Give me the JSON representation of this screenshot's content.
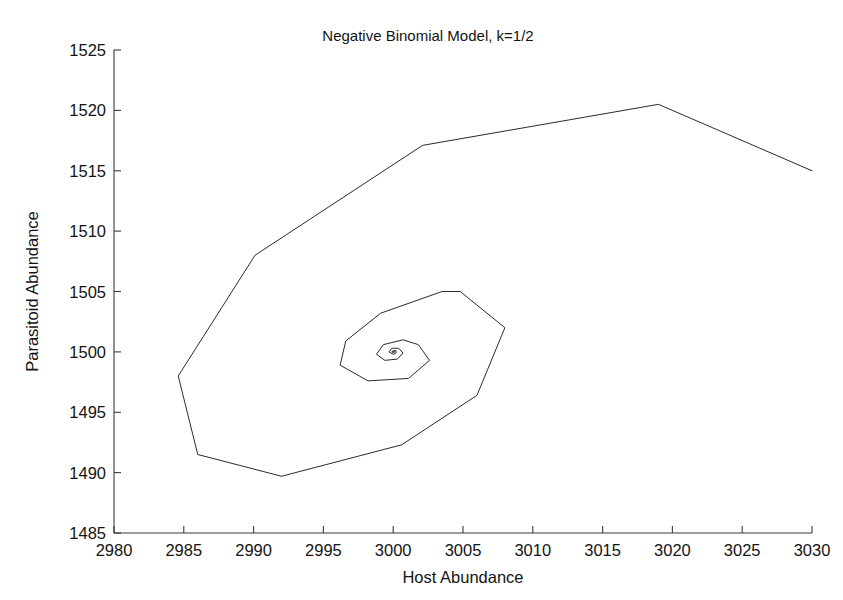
{
  "chart_data": {
    "type": "line",
    "title": "Negative Binomial Model, k=1/2",
    "xlabel": "Host Abundance",
    "ylabel": "Parasitoid Abundance",
    "xlim": [
      2980,
      3030
    ],
    "ylim": [
      1485,
      1525
    ],
    "xticks": [
      2980,
      2985,
      2990,
      2995,
      3000,
      3005,
      3010,
      3015,
      3020,
      3025,
      3030
    ],
    "yticks": [
      1485,
      1490,
      1495,
      1500,
      1505,
      1510,
      1515,
      1520,
      1525
    ],
    "xtick_labels": [
      "2980",
      "2985",
      "2990",
      "2995",
      "3000",
      "3005",
      "3010",
      "3015",
      "3020",
      "3025",
      "3030"
    ],
    "ytick_labels": [
      "1485",
      "1490",
      "1495",
      "1500",
      "1505",
      "1510",
      "1515",
      "1520",
      "1525"
    ],
    "grid": false,
    "legend": false,
    "legend_position": "none",
    "line_color": "#2b2b2b",
    "background_color": "#ffffff",
    "axis_color": "#3a3a3a",
    "fixed_point": [
      3000,
      1500
    ],
    "series": [
      {
        "name": "Phase trajectory",
        "points": [
          [
            3030.0,
            1515.0
          ],
          [
            3019.0,
            1520.5
          ],
          [
            3002.1,
            1517.1
          ],
          [
            2990.1,
            1508.0
          ],
          [
            2984.6,
            1498.0
          ],
          [
            2986.0,
            1491.5
          ],
          [
            2992.0,
            1489.7
          ],
          [
            3000.6,
            1492.3
          ],
          [
            3006.0,
            1496.4
          ],
          [
            3008.0,
            1502.0
          ],
          [
            3004.8,
            1505.0
          ],
          [
            3003.5,
            1505.0
          ],
          [
            2999.1,
            1503.2
          ],
          [
            2996.6,
            1500.9
          ],
          [
            2996.2,
            1498.9
          ],
          [
            2998.2,
            1497.6
          ],
          [
            3001.1,
            1497.8
          ],
          [
            3002.6,
            1499.3
          ],
          [
            3001.8,
            1500.6
          ],
          [
            3000.7,
            1501.0
          ],
          [
            2999.3,
            1500.6
          ],
          [
            2998.8,
            1499.8
          ],
          [
            2999.4,
            1499.3
          ],
          [
            3000.3,
            1499.4
          ],
          [
            3000.7,
            1499.9
          ],
          [
            3000.4,
            1500.3
          ],
          [
            2999.9,
            1500.3
          ],
          [
            2999.7,
            1500.0
          ],
          [
            3000.0,
            1499.8
          ],
          [
            3000.2,
            1499.9
          ],
          [
            3000.2,
            1500.1
          ],
          [
            3000.0,
            1500.1
          ],
          [
            2999.9,
            1500.0
          ],
          [
            3000.0,
            1499.95
          ],
          [
            3000.1,
            1500.0
          ],
          [
            3000.0,
            1500.05
          ],
          [
            3000.0,
            1500.0
          ]
        ]
      }
    ]
  },
  "figure": {
    "title": "Negative Binomial Model, k=1/2",
    "xlabel": "Host Abundance",
    "ylabel": "Parasitoid Abundance"
  }
}
